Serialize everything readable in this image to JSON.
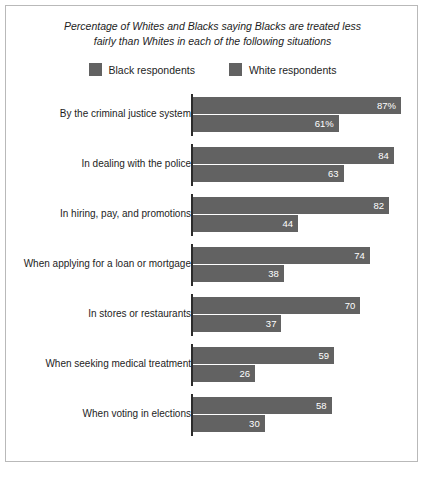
{
  "chart_data": {
    "type": "bar",
    "orientation": "horizontal",
    "title": "Percentage of Whites and Blacks saying Blacks are treated less fairly than Whites in each of the following situations",
    "title_line1": "Percentage of Whites and Blacks saying Blacks are treated less",
    "title_line2": "fairly than Whites in each of the following situations",
    "xlabel": "",
    "ylabel": "",
    "xlim": [
      0,
      100
    ],
    "grid": false,
    "legend_position": "top-center",
    "categories": [
      "By the criminal justice system",
      "In dealing with the police",
      "In hiring, pay, and promotions",
      "When applying for a loan or mortgage",
      "In stores or restaurants",
      "When seeking medical treatment",
      "When voting in elections"
    ],
    "series": [
      {
        "name": "Black respondents",
        "color": "#626262",
        "values": [
          87,
          84,
          82,
          74,
          70,
          59,
          58
        ],
        "labels": [
          "87%",
          "84",
          "82",
          "74",
          "70",
          "59",
          "58"
        ]
      },
      {
        "name": "White respondents",
        "color": "#626262",
        "values": [
          61,
          63,
          44,
          38,
          37,
          26,
          30
        ],
        "labels": [
          "61%",
          "63",
          "44",
          "38",
          "37",
          "26",
          "30"
        ]
      }
    ]
  },
  "legend": {
    "items": [
      {
        "label": "Black respondents",
        "color": "#626262"
      },
      {
        "label": "White respondents",
        "color": "#626262"
      }
    ]
  },
  "colors": {
    "bar": "#626262",
    "axis": "#2b2b2b",
    "frame": "#b9b9b9",
    "text": "#1d1d1d",
    "value_text": "#ffffff",
    "background": "#ffffff"
  }
}
